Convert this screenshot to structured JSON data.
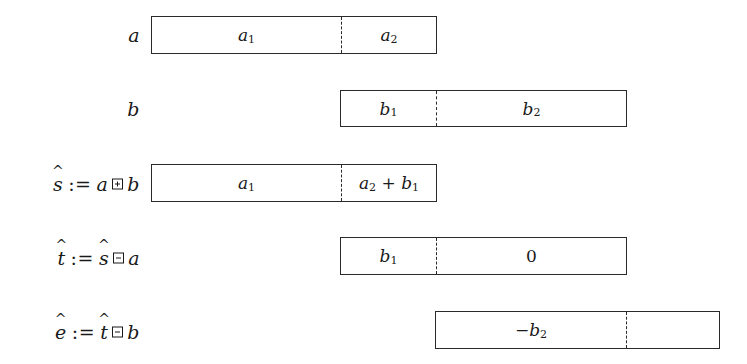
{
  "diagram": {
    "rows": [
      {
        "label": {
          "parts": [
            "a"
          ]
        },
        "box": {
          "x": 151,
          "y": 16,
          "width": 286,
          "height": 38,
          "divider_x": 341
        },
        "segments": [
          {
            "text": "a",
            "sub": "1"
          },
          {
            "text": "a",
            "sub": "2"
          }
        ]
      },
      {
        "label": {
          "parts": [
            "b"
          ]
        },
        "box": {
          "x": 340,
          "y": 90,
          "width": 287,
          "height": 37,
          "divider_x": 436
        },
        "segments": [
          {
            "text": "b",
            "sub": "1"
          },
          {
            "text": "b",
            "sub": "2"
          }
        ]
      },
      {
        "label": {
          "var": "s",
          "hat": true,
          "assign": ":=",
          "lhs": "a",
          "op": "boxplus",
          "rhs": "b"
        },
        "box": {
          "x": 151,
          "y": 164,
          "width": 286,
          "height": 38,
          "divider_x": 341
        },
        "segments": [
          {
            "text": "a",
            "sub": "1"
          },
          {
            "text": "a",
            "sub": "2",
            "suffix": " + ",
            "text2": "b",
            "sub2": "1"
          }
        ]
      },
      {
        "label": {
          "var": "t",
          "hat": true,
          "assign": ":=",
          "lhs": "ŝ",
          "op": "boxminus",
          "rhs": "a"
        },
        "box": {
          "x": 340,
          "y": 237,
          "width": 287,
          "height": 38,
          "divider_x": 436
        },
        "segments": [
          {
            "text": "b",
            "sub": "1"
          },
          {
            "text": "0"
          }
        ]
      },
      {
        "label": {
          "var": "e",
          "hat": true,
          "assign": ":=",
          "lhs": "t̂",
          "op": "boxminus",
          "rhs": "b"
        },
        "box": {
          "x": 435,
          "y": 311,
          "width": 285,
          "height": 38,
          "divider_x": 626
        },
        "segments": [
          {
            "text": "−b",
            "sub": "2"
          },
          {
            "text": ""
          }
        ]
      }
    ],
    "labels": {
      "row0": "a",
      "row1": "b",
      "row2_var": "s",
      "row2_assign": ":=",
      "row2_lhs": "a",
      "row2_rhs": "b",
      "row3_var": "t",
      "row3_assign": ":=",
      "row3_lhs": "s",
      "row3_rhs": "a",
      "row4_var": "e",
      "row4_assign": ":=",
      "row4_lhs": "t",
      "row4_rhs": "b"
    },
    "cells": {
      "r0c0": "a",
      "r0c0_sub": "1",
      "r0c1": "a",
      "r0c1_sub": "2",
      "r1c0": "b",
      "r1c0_sub": "1",
      "r1c1": "b",
      "r1c1_sub": "2",
      "r2c0": "a",
      "r2c0_sub": "1",
      "r2c1a": "a",
      "r2c1a_sub": "2",
      "r2c1_plus": " + ",
      "r2c1b": "b",
      "r2c1b_sub": "1",
      "r3c0": "b",
      "r3c0_sub": "1",
      "r3c1": "0",
      "r4c0": "−b",
      "r4c0_sub": "2",
      "r4c1": ""
    },
    "colors": {
      "stroke": "#2a2a2a",
      "text": "#1a1a1a",
      "background": "#ffffff"
    }
  }
}
